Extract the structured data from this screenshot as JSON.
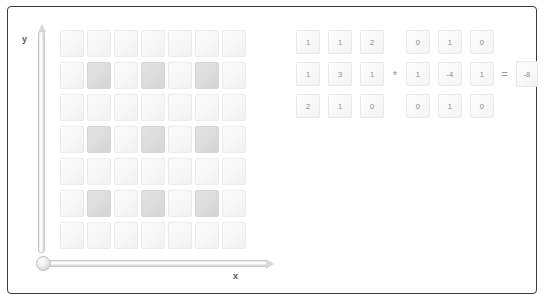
{
  "figure": {
    "axes": {
      "x_label": "x",
      "y_label": "y"
    },
    "grid": {
      "rows": 7,
      "cols": 7,
      "shaded_color": "#dcdcdc",
      "unshaded_color": "#f7f7f7",
      "pattern": [
        [
          0,
          0,
          0,
          0,
          0,
          0,
          0
        ],
        [
          0,
          1,
          0,
          1,
          0,
          1,
          0
        ],
        [
          0,
          0,
          0,
          0,
          0,
          0,
          0
        ],
        [
          0,
          1,
          0,
          1,
          0,
          1,
          0
        ],
        [
          0,
          0,
          0,
          0,
          0,
          0,
          0
        ],
        [
          0,
          1,
          0,
          1,
          0,
          1,
          0
        ],
        [
          0,
          0,
          0,
          0,
          0,
          0,
          0
        ]
      ]
    },
    "equation": {
      "operator_convolve": "*",
      "operator_equals": "=",
      "patch": [
        [
          "1",
          "1",
          "2"
        ],
        [
          "1",
          "3",
          "1"
        ],
        [
          "2",
          "1",
          "0"
        ]
      ],
      "kernel": [
        [
          "0",
          "1",
          "0"
        ],
        [
          "1",
          "-4",
          "1"
        ],
        [
          "0",
          "1",
          "0"
        ]
      ],
      "result": "-8"
    }
  }
}
